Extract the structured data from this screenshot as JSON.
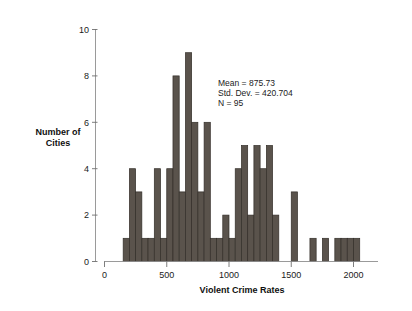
{
  "chart_data": {
    "type": "bar",
    "title": "",
    "xlabel": "Violent Crime Rates",
    "ylabel": "Number of Cities",
    "ylabel_lines": [
      "Number of",
      "Cities"
    ],
    "xlim": [
      0,
      2150
    ],
    "ylim": [
      0,
      10
    ],
    "grid": false,
    "legend": "none",
    "bin_width": 50,
    "bin_starts": [
      150,
      200,
      250,
      300,
      350,
      400,
      450,
      500,
      550,
      600,
      650,
      700,
      750,
      800,
      850,
      900,
      950,
      1000,
      1050,
      1100,
      1150,
      1200,
      1250,
      1300,
      1350,
      1500,
      1650,
      1750,
      1850,
      1900,
      1950,
      2000
    ],
    "categories": [
      "150-200",
      "200-250",
      "250-300",
      "300-350",
      "350-400",
      "400-450",
      "450-500",
      "500-550",
      "550-600",
      "600-650",
      "650-700",
      "700-750",
      "750-800",
      "800-850",
      "850-900",
      "900-950",
      "950-1000",
      "1000-1050",
      "1050-1100",
      "1100-1150",
      "1150-1200",
      "1200-1250",
      "1250-1300",
      "1300-1350",
      "1350-1400",
      "1500-1550",
      "1650-1700",
      "1750-1800",
      "1850-1900",
      "1900-1950",
      "1950-2000",
      "2000-2050"
    ],
    "values": [
      1,
      4,
      3,
      1,
      1,
      4,
      1,
      4,
      8,
      3,
      9,
      6,
      3,
      6,
      1,
      1,
      2,
      1,
      4,
      5,
      2,
      5,
      4,
      5,
      2,
      3,
      1,
      1,
      1,
      1,
      1,
      1
    ],
    "xticks": [
      0,
      500,
      1000,
      1500,
      2000
    ],
    "xtick_labels": [
      "0",
      "500",
      "1000",
      "1500",
      "2000"
    ],
    "yticks": [
      0,
      2,
      4,
      6,
      8,
      10
    ],
    "ytick_labels": [
      "0",
      "2",
      "4",
      "6",
      "8",
      "10"
    ],
    "bar_color": "#5a534c",
    "bar_edge_color": "#332e29"
  },
  "annotation": {
    "mean_label": "Mean = 875.73",
    "stddev_label": "Std. Dev. = 420.704",
    "n_label": "N = 95"
  }
}
